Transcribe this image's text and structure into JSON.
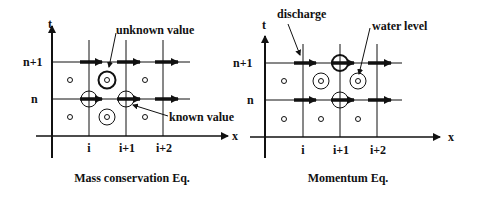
{
  "left": {
    "title": "Mass conservation Eq.",
    "axis_t": "t",
    "axis_x": "x",
    "row_labels": [
      "n+1",
      "n"
    ],
    "col_labels": [
      "i",
      "i+1",
      "i+2"
    ],
    "annotations": {
      "unknown": "unknown value",
      "known": "known value"
    }
  },
  "right": {
    "title": "Momentum Eq.",
    "axis_t": "t",
    "axis_x": "x",
    "row_labels": [
      "n+1",
      "n"
    ],
    "col_labels": [
      "i",
      "i+1",
      "i+2"
    ],
    "annotations": {
      "discharge": "discharge",
      "water_level": "water level"
    }
  }
}
